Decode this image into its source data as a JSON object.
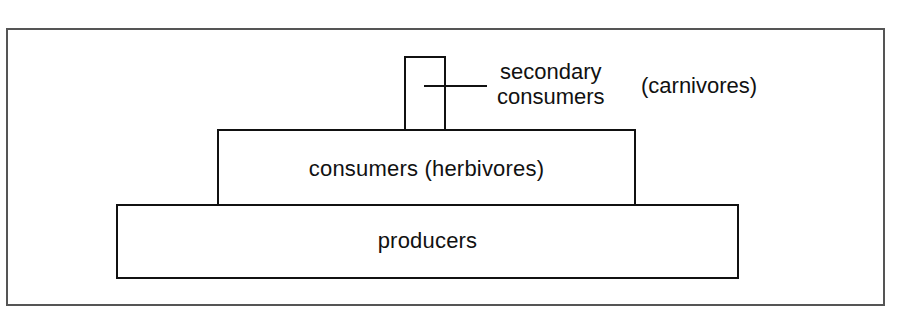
{
  "diagram": {
    "type": "trophic-pyramid",
    "levels": [
      {
        "id": "producers",
        "label": "producers"
      },
      {
        "id": "consumers",
        "label": "consumers (herbivores)"
      },
      {
        "id": "secondary-consumers",
        "label_line1": "secondary",
        "label_line2": "consumers",
        "annotation": "(carnivores)"
      }
    ],
    "colors": {
      "stroke": "#111111",
      "frame": "#555555",
      "background": "#ffffff"
    }
  }
}
